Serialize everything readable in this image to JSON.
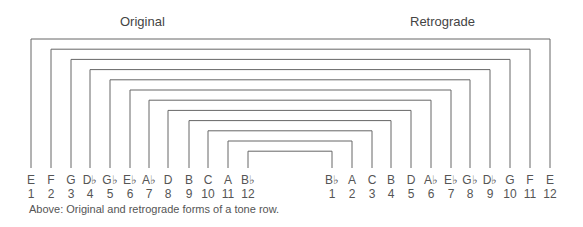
{
  "headers": {
    "original": "Original",
    "retrograde": "Retrograde"
  },
  "original": {
    "notes": [
      "E",
      "F",
      "G",
      "D♭",
      "G♭",
      "E♭",
      "A♭",
      "D",
      "B",
      "C",
      "A",
      "B♭"
    ],
    "numbers": [
      "1",
      "2",
      "3",
      "4",
      "5",
      "6",
      "7",
      "8",
      "9",
      "10",
      "11",
      "12"
    ]
  },
  "retrograde": {
    "notes": [
      "B♭",
      "A",
      "C",
      "B",
      "D",
      "A♭",
      "E♭",
      "G♭",
      "D♭",
      "G",
      "F",
      "E"
    ],
    "numbers": [
      "1",
      "2",
      "3",
      "4",
      "5",
      "6",
      "7",
      "8",
      "9",
      "10",
      "11",
      "12"
    ]
  },
  "caption": "Above: Original and retrograde forms of a tone row.",
  "colors": {
    "line": "#666666",
    "text": "#555555"
  }
}
